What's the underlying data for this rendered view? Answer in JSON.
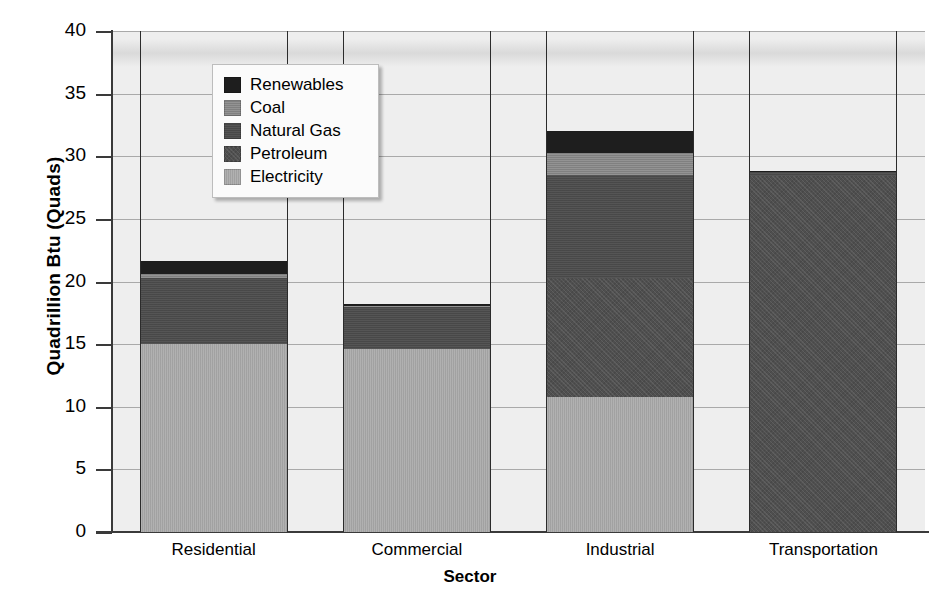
{
  "chart_data": {
    "type": "bar",
    "subtype": "stacked-bar",
    "title": "",
    "xlabel": "Sector",
    "ylabel": "Quadrillion Btu (Quads)",
    "categories": [
      "Residential",
      "Commercial",
      "Industrial",
      "Transportation"
    ],
    "ylim": [
      0,
      40
    ],
    "yticks": [
      0,
      5,
      10,
      15,
      20,
      25,
      30,
      35,
      40
    ],
    "ytick_labels": [
      "0",
      "5",
      "10",
      "15",
      "20",
      "25",
      "30",
      "35",
      "40"
    ],
    "grid": "horizontal",
    "legend_position": "upper-left-inside",
    "stack_order_bottom_to_top": [
      "Electricity",
      "Petroleum",
      "Natural Gas",
      "Coal",
      "Renewables"
    ],
    "series": [
      {
        "name": "Electricity",
        "color": "#a8a8a8",
        "values": [
          15.0,
          14.6,
          10.8,
          0.0
        ]
      },
      {
        "name": "Petroleum",
        "color": "#4f4f4f",
        "values": [
          0.0,
          0.0,
          9.5,
          28.5
        ]
      },
      {
        "name": "Natural Gas",
        "color": "#4c4c4c",
        "values": [
          5.3,
          3.4,
          8.2,
          0.3
        ]
      },
      {
        "name": "Coal",
        "color": "#878787",
        "values": [
          0.4,
          0.1,
          1.8,
          0.0
        ]
      },
      {
        "name": "Renewables",
        "color": "#1e1e1e",
        "values": [
          0.9,
          0.1,
          1.7,
          0.0
        ]
      }
    ],
    "totals": [
      21.6,
      18.2,
      32.0,
      28.8
    ]
  },
  "legend": {
    "items": [
      {
        "label": "Renewables",
        "swatch": "legend-swatch-renewables",
        "color": "#1e1e1e"
      },
      {
        "label": "Coal",
        "swatch": "legend-swatch-coal",
        "color": "#878787"
      },
      {
        "label": "Natural Gas",
        "swatch": "legend-swatch-natural-gas",
        "color": "#4c4c4c"
      },
      {
        "label": "Petroleum",
        "swatch": "legend-swatch-petroleum",
        "color": "#4f4f4f"
      },
      {
        "label": "Electricity",
        "swatch": "legend-swatch-electricity",
        "color": "#a8a8a8"
      }
    ]
  },
  "axes": {
    "y_title": "Quadrillion Btu (Quads)",
    "x_title": "Sector"
  }
}
